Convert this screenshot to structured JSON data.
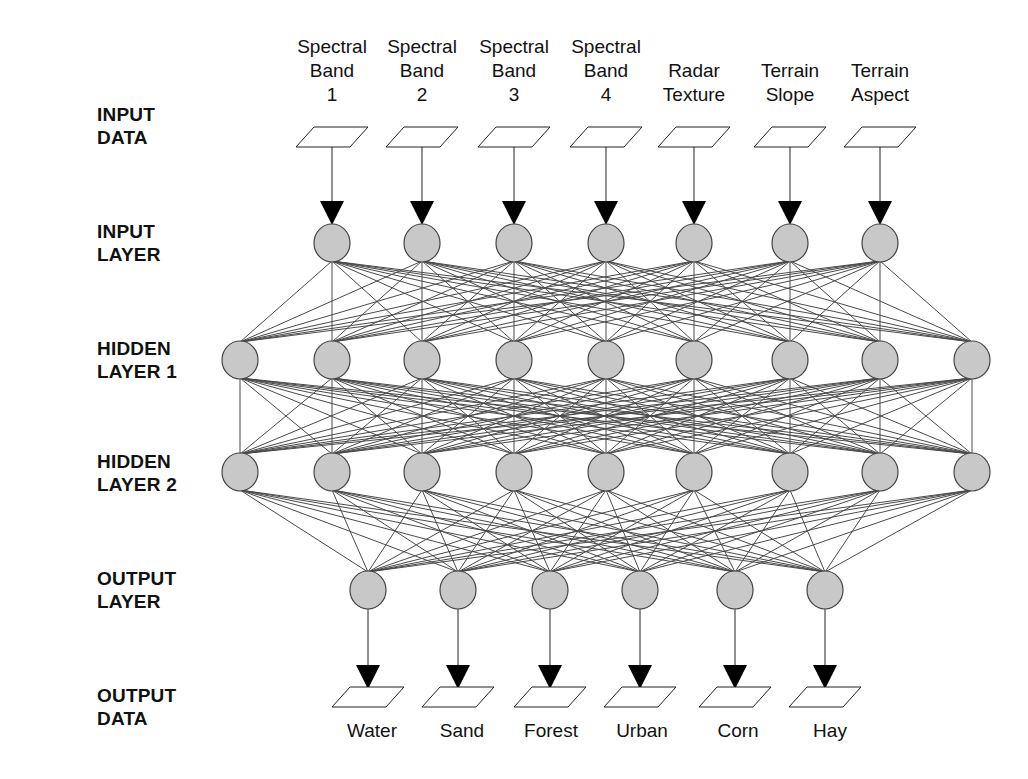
{
  "layer_labels": {
    "input_data": "INPUT\nDATA",
    "input_layer": "INPUT\nLAYER",
    "hidden_layer_1": "HIDDEN\nLAYER 1",
    "hidden_layer_2": "HIDDEN\nLAYER 2",
    "output_layer": "OUTPUT\nLAYER",
    "output_data": "OUTPUT\nDATA"
  },
  "inputs": [
    {
      "label": "Spectral\nBand\n1",
      "x": 332
    },
    {
      "label": "Spectral\nBand\n2",
      "x": 422
    },
    {
      "label": "Spectral\nBand\n3",
      "x": 514
    },
    {
      "label": "Spectral\nBand\n4",
      "x": 606
    },
    {
      "label": "Radar\nTexture",
      "x": 694
    },
    {
      "label": "Terrain\nSlope",
      "x": 790
    },
    {
      "label": "Terrain\nAspect",
      "x": 880
    }
  ],
  "outputs": [
    {
      "label": "Water",
      "x": 368
    },
    {
      "label": "Sand",
      "x": 458
    },
    {
      "label": "Forest",
      "x": 550
    },
    {
      "label": "Urban",
      "x": 640
    },
    {
      "label": "Corn",
      "x": 735
    },
    {
      "label": "Hay",
      "x": 825
    }
  ],
  "hidden_nodes_x": [
    240,
    332,
    422,
    514,
    606,
    694,
    790,
    880,
    972
  ],
  "layout": {
    "input_box_y": 137,
    "input_layer_y": 243,
    "hidden1_y": 360,
    "hidden2_y": 472,
    "output_layer_y": 590,
    "output_box_y": 697,
    "node_radius": 18
  },
  "colors": {
    "node_fill": "#c8c8c8",
    "node_stroke": "#444444",
    "edge": "#4a4a4a",
    "arrow": "#000000"
  }
}
